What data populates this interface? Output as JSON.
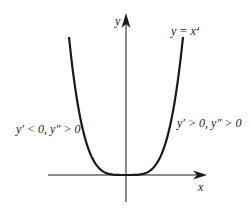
{
  "chart_data": {
    "type": "line",
    "title": "",
    "function_label": "y = x",
    "function_exponent": "4",
    "xlabel": "x",
    "ylabel": "y",
    "series": [
      {
        "name": "y = x^4",
        "x": [
          -1.0,
          -0.8,
          -0.6,
          -0.4,
          -0.2,
          0.0,
          0.2,
          0.4,
          0.6,
          0.8,
          1.0
        ],
        "values": [
          1.0,
          0.4096,
          0.1296,
          0.0256,
          0.0016,
          0.0,
          0.0016,
          0.0256,
          0.1296,
          0.4096,
          1.0
        ]
      }
    ],
    "annotations": [
      {
        "text": "y′ < 0, y″ > 0",
        "position": "left",
        "meaning": "decreasing, concave up"
      },
      {
        "text": "y′ > 0, y″ > 0",
        "position": "right",
        "meaning": "increasing, concave up"
      }
    ],
    "xlim": [
      -1.1,
      1.4
    ],
    "ylim": [
      -0.2,
      1.2
    ],
    "grid": false,
    "legend": "none",
    "ticks": "none"
  },
  "labels": {
    "y_axis": "y",
    "x_axis": "x",
    "function_base": "y = x",
    "function_exp": "4",
    "left_annotation": "y′ < 0, y″ > 0",
    "right_annotation": "y′ > 0, y″ > 0"
  },
  "colors": {
    "curve": "#1a1a1a",
    "axes": "#1a1a1a",
    "background": "#ffffff"
  }
}
